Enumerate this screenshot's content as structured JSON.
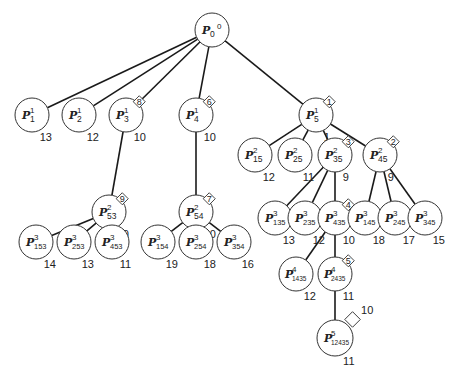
{
  "diagram": {
    "type": "branch-and-bound search tree",
    "nodes": [
      {
        "id": "P0_0",
        "base": "P",
        "sup": "0",
        "sub": "0",
        "x": 212,
        "y": 30,
        "r": 17,
        "bound": "",
        "order": "",
        "sup_pos": "after"
      },
      {
        "id": "P1_1",
        "base": "P",
        "sup": "1",
        "sub": "1",
        "x": 32,
        "y": 115,
        "r": 17,
        "bound": "13",
        "order": ""
      },
      {
        "id": "P1_2",
        "base": "P",
        "sup": "1",
        "sub": "2",
        "x": 79,
        "y": 115,
        "r": 17,
        "bound": "12",
        "order": ""
      },
      {
        "id": "P1_3",
        "base": "P",
        "sup": "1",
        "sub": "3",
        "x": 126,
        "y": 115,
        "r": 17,
        "bound": "10",
        "order": "8"
      },
      {
        "id": "P1_4",
        "base": "P",
        "sup": "1",
        "sub": "4",
        "x": 196,
        "y": 115,
        "r": 17,
        "bound": "10",
        "order": "6"
      },
      {
        "id": "P1_5",
        "base": "P",
        "sup": "1",
        "sub": "5",
        "x": 316,
        "y": 115,
        "r": 17,
        "bound": "1",
        "order": "1"
      },
      {
        "id": "P2_53",
        "base": "P",
        "sup": "2",
        "sub": "53",
        "x": 109,
        "y": 212,
        "r": 17,
        "bound": "10",
        "order": "9"
      },
      {
        "id": "P2_54",
        "base": "P",
        "sup": "2",
        "sub": "54",
        "x": 196,
        "y": 212,
        "r": 17,
        "bound": "10",
        "order": "7"
      },
      {
        "id": "P2_15",
        "base": "P",
        "sup": "2",
        "sub": "15",
        "x": 255,
        "y": 155,
        "r": 17,
        "bound": "12",
        "order": ""
      },
      {
        "id": "P2_25",
        "base": "P",
        "sup": "2",
        "sub": "25",
        "x": 295,
        "y": 155,
        "r": 17,
        "bound": "11",
        "order": ""
      },
      {
        "id": "P2_35",
        "base": "P",
        "sup": "2",
        "sub": "35",
        "x": 335,
        "y": 155,
        "r": 17,
        "bound": "9",
        "order": "3"
      },
      {
        "id": "P2_45",
        "base": "P",
        "sup": "2",
        "sub": "45",
        "x": 380,
        "y": 155,
        "r": 17,
        "bound": "9",
        "order": "2"
      },
      {
        "id": "P3_153",
        "base": "P",
        "sup": "3",
        "sub": "153",
        "x": 36,
        "y": 242,
        "r": 17,
        "bound": "14",
        "order": ""
      },
      {
        "id": "P3_253",
        "base": "P",
        "sup": "3",
        "sub": "253",
        "x": 74,
        "y": 242,
        "r": 17,
        "bound": "13",
        "order": ""
      },
      {
        "id": "P3_453",
        "base": "P",
        "sup": "3",
        "sub": "453",
        "x": 112,
        "y": 242,
        "r": 17,
        "bound": "11",
        "order": ""
      },
      {
        "id": "P3_154",
        "base": "P",
        "sup": "3",
        "sub": "154",
        "x": 158,
        "y": 242,
        "r": 17,
        "bound": "19",
        "order": ""
      },
      {
        "id": "P3_254",
        "base": "P",
        "sup": "3",
        "sub": "254",
        "x": 196,
        "y": 242,
        "r": 17,
        "bound": "18",
        "order": ""
      },
      {
        "id": "P3_354",
        "base": "P",
        "sup": "3",
        "sub": "354",
        "x": 234,
        "y": 242,
        "r": 17,
        "bound": "16",
        "order": ""
      },
      {
        "id": "P3_135",
        "base": "P",
        "sup": "3",
        "sub": "135",
        "x": 275,
        "y": 218,
        "r": 17,
        "bound": "13",
        "order": ""
      },
      {
        "id": "P3_235",
        "base": "P",
        "sup": "3",
        "sub": "235",
        "x": 305,
        "y": 218,
        "r": 17,
        "bound": "12",
        "order": ""
      },
      {
        "id": "P3_435",
        "base": "P",
        "sup": "3",
        "sub": "435",
        "x": 335,
        "y": 218,
        "r": 17,
        "bound": "10",
        "order": "4"
      },
      {
        "id": "P3_145",
        "base": "P",
        "sup": "3",
        "sub": "145",
        "x": 365,
        "y": 218,
        "r": 17,
        "bound": "18",
        "order": ""
      },
      {
        "id": "P3_245",
        "base": "P",
        "sup": "3",
        "sub": "245",
        "x": 395,
        "y": 218,
        "r": 17,
        "bound": "17",
        "order": ""
      },
      {
        "id": "P3_345",
        "base": "P",
        "sup": "3",
        "sub": "345",
        "x": 425,
        "y": 218,
        "r": 17,
        "bound": "15",
        "order": ""
      },
      {
        "id": "P4_1435",
        "base": "P",
        "sup": "4",
        "sub": "1435",
        "x": 296,
        "y": 274,
        "r": 17,
        "bound": "12",
        "order": ""
      },
      {
        "id": "P4_2435",
        "base": "P",
        "sup": "4",
        "sub": "2435",
        "x": 335,
        "y": 274,
        "r": 17,
        "bound": "11",
        "order": "5"
      },
      {
        "id": "P5_12435",
        "base": "P",
        "sup": "5",
        "sub": "12435",
        "x": 335,
        "y": 338,
        "r": 18,
        "bound": "11",
        "order": "10"
      }
    ],
    "edges": [
      [
        "P0_0",
        "P1_1"
      ],
      [
        "P0_0",
        "P1_2"
      ],
      [
        "P0_0",
        "P1_3"
      ],
      [
        "P0_0",
        "P1_4"
      ],
      [
        "P0_0",
        "P1_5"
      ],
      [
        "P1_3",
        "P2_53"
      ],
      [
        "P1_4",
        "P2_54"
      ],
      [
        "P1_5",
        "P2_15"
      ],
      [
        "P1_5",
        "P2_25"
      ],
      [
        "P1_5",
        "P2_35"
      ],
      [
        "P1_5",
        "P2_45"
      ],
      [
        "P2_53",
        "P3_153"
      ],
      [
        "P2_53",
        "P3_253"
      ],
      [
        "P2_53",
        "P3_453"
      ],
      [
        "P2_54",
        "P3_154"
      ],
      [
        "P2_54",
        "P3_254"
      ],
      [
        "P2_54",
        "P3_354"
      ],
      [
        "P2_35",
        "P3_135"
      ],
      [
        "P2_35",
        "P3_235"
      ],
      [
        "P2_35",
        "P3_435"
      ],
      [
        "P2_45",
        "P3_145"
      ],
      [
        "P2_45",
        "P3_245"
      ],
      [
        "P2_45",
        "P3_345"
      ],
      [
        "P3_435",
        "P4_1435"
      ],
      [
        "P3_435",
        "P4_2435"
      ],
      [
        "P4_2435",
        "P5_12435"
      ]
    ]
  }
}
